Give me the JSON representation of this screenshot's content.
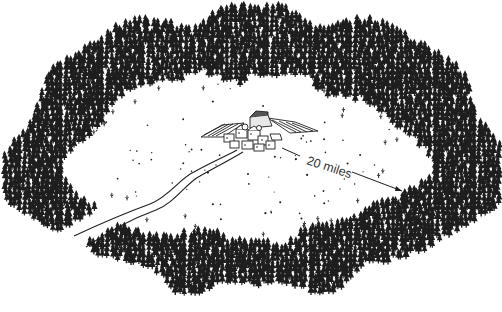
{
  "illustration": {
    "type": "line-drawing",
    "subject": "village in a forest clearing",
    "colors": {
      "ink": "#1e1e1e",
      "background": "#ffffff",
      "label": "#333333"
    },
    "forest": {
      "shape": "elliptical ring",
      "tree_icon": "pine-tree-icon",
      "outer_ellipse": {
        "cx": 256,
        "cy": 150,
        "rx": 248,
        "ry": 138
      },
      "inner_clearing": {
        "cx": 240,
        "cy": 158,
        "rx": 176,
        "ry": 82
      }
    },
    "village": {
      "icon": "village-icon",
      "position": {
        "x": 245,
        "y": 135
      }
    },
    "road": {
      "icon": "road-icon",
      "from": "village",
      "direction": "lower-left, exits forest through gap"
    },
    "distance_marker": {
      "label": "20 miles",
      "from": {
        "x": 282,
        "y": 148
      },
      "to": {
        "x": 402,
        "y": 192
      }
    }
  }
}
